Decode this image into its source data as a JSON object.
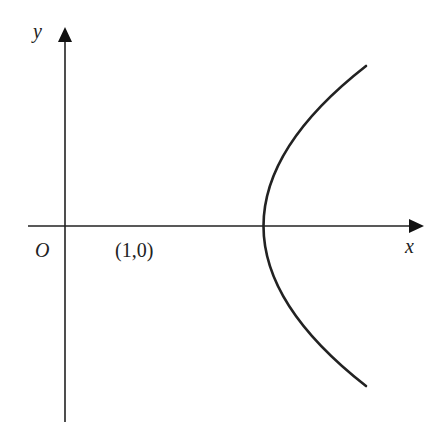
{
  "diagram": {
    "type": "parabola-graph",
    "axes": {
      "x_label": "x",
      "y_label": "y",
      "origin_label": "O"
    },
    "vertex_label": "(1,0)",
    "curve": {
      "description": "Parabola opening to the right with vertex at (1,0)",
      "vertex": [
        1,
        0
      ],
      "color": "#222222"
    },
    "colors": {
      "stroke": "#222222",
      "background": "#ffffff"
    }
  }
}
